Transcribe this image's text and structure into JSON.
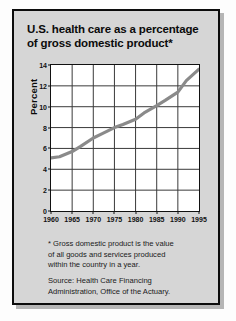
{
  "chart_data": {
    "type": "line",
    "title": "U.S. health care as a percentage of gross domestic product*",
    "title_line1": "U.S. health care as a percentage",
    "title_line2": "of gross domestic product*",
    "xlabel": "",
    "ylabel": "Percent",
    "xlim": [
      1960,
      1995
    ],
    "ylim": [
      0,
      14
    ],
    "grid": true,
    "legend": "none",
    "x_ticks": [
      1960,
      1965,
      1970,
      1975,
      1980,
      1985,
      1990,
      1995
    ],
    "y_ticks": [
      0,
      2,
      4,
      6,
      8,
      10,
      12,
      14
    ],
    "series": [
      {
        "name": "Health care share of GDP",
        "color": "#8a8a8a",
        "x": [
          1960,
          1962,
          1965,
          1967,
          1970,
          1972,
          1975,
          1977,
          1980,
          1982,
          1985,
          1987,
          1990,
          1992,
          1995
        ],
        "values": [
          5.1,
          5.2,
          5.7,
          6.2,
          7.0,
          7.4,
          8.0,
          8.3,
          8.8,
          9.4,
          10.1,
          10.6,
          11.4,
          12.5,
          13.6
        ]
      }
    ],
    "annotations": {
      "footnote": "* Gross domestic product is the value of all goods and services produced within the country in a year.",
      "footnote_lines": [
        "* Gross domestic product is the value",
        "of all goods and services produced",
        "within the country in a year."
      ],
      "source": "Source: Health Care Financing Administration, Office of the Actuary.",
      "source_lines": [
        "Source: Health Care Financing",
        "Administration, Office of the Actuary."
      ]
    },
    "colors": {
      "panel_background": "#d6d6d6",
      "plot_background": "#ffffff",
      "grid": "#3a3a3a",
      "frame": "#0c0c0c",
      "line": "#8a8a8a",
      "text": "#111111"
    }
  }
}
